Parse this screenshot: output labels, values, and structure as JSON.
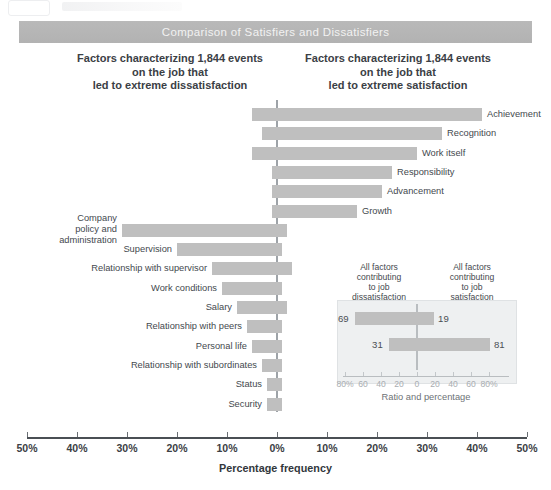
{
  "banner": {
    "title": "Comparison of Satisfiers and Dissatisfiers"
  },
  "captions": {
    "left": "Factors characterizing 1,844 events\non the job that\nled to extreme dissatisfaction",
    "right": "Factors characterizing 1,844 events\non the job that\nled to extreme satisfaction"
  },
  "axis": {
    "title": "Percentage frequency",
    "ticks": [
      "50%",
      "40%",
      "30%",
      "20%",
      "10%",
      "0%",
      "10%",
      "20%",
      "30%",
      "40%",
      "50%"
    ]
  },
  "inset": {
    "left_caption": "All factors\ncontributing\nto job\ndissatisfaction",
    "right_caption": "All factors\ncontributing\nto job\nsatisfaction",
    "title": "Ratio and percentage",
    "ticks": [
      "80%",
      "60",
      "40",
      "20",
      "0",
      "20",
      "40",
      "60",
      "80%"
    ]
  },
  "colors": {
    "bar": "#bfbfbf",
    "banner": "#b5b5b5",
    "axis": "#9ea3a8",
    "text": "#3f4448",
    "inset_panel": "#eef0f1"
  },
  "chart_data": {
    "type": "bar",
    "title": "Comparison of Satisfiers and Dissatisfiers",
    "xlabel": "Percentage frequency",
    "ylabel": "",
    "xlim": [
      -50,
      50
    ],
    "grid": false,
    "legend": "none",
    "orientation": "horizontal-diverging",
    "note": "Diverging bars: negative = percent of extreme dissatisfaction events, positive = percent of extreme satisfaction events",
    "categories": [
      "Achievement",
      "Recognition",
      "Work itself",
      "Responsibility",
      "Advancement",
      "Growth",
      "Company policy and administration",
      "Supervision",
      "Relationship with supervisor",
      "Work conditions",
      "Salary",
      "Relationship with peers",
      "Personal life",
      "Relationship with subordinates",
      "Status",
      "Security"
    ],
    "series": [
      {
        "name": "Extreme dissatisfaction (left of 0%)",
        "values": [
          5,
          3,
          5,
          1,
          1,
          1,
          31,
          20,
          13,
          11,
          8,
          6,
          5,
          3,
          2,
          2
        ]
      },
      {
        "name": "Extreme satisfaction (right of 0%)",
        "values": [
          41,
          33,
          28,
          23,
          21,
          16,
          2,
          1,
          3,
          1,
          2,
          1,
          1,
          1,
          1,
          1
        ]
      }
    ],
    "labels": [
      {
        "label": "Achievement",
        "dissatisfaction": 5,
        "satisfaction": 41
      },
      {
        "label": "Recognition",
        "dissatisfaction": 3,
        "satisfaction": 33
      },
      {
        "label": "Work itself",
        "dissatisfaction": 5,
        "satisfaction": 28
      },
      {
        "label": "Responsibility",
        "dissatisfaction": 1,
        "satisfaction": 23
      },
      {
        "label": "Advancement",
        "dissatisfaction": 1,
        "satisfaction": 21
      },
      {
        "label": "Growth",
        "dissatisfaction": 1,
        "satisfaction": 16
      },
      {
        "label": "Company policy and administration",
        "dissatisfaction": 31,
        "satisfaction": 2
      },
      {
        "label": "Supervision",
        "dissatisfaction": 20,
        "satisfaction": 1
      },
      {
        "label": "Relationship with supervisor",
        "dissatisfaction": 13,
        "satisfaction": 3
      },
      {
        "label": "Work conditions",
        "dissatisfaction": 11,
        "satisfaction": 1
      },
      {
        "label": "Salary",
        "dissatisfaction": 8,
        "satisfaction": 2
      },
      {
        "label": "Relationship with peers",
        "dissatisfaction": 6,
        "satisfaction": 1
      },
      {
        "label": "Personal life",
        "dissatisfaction": 5,
        "satisfaction": 1
      },
      {
        "label": "Relationship with subordinates",
        "dissatisfaction": 3,
        "satisfaction": 1
      },
      {
        "label": "Status",
        "dissatisfaction": 2,
        "satisfaction": 1
      },
      {
        "label": "Security",
        "dissatisfaction": 2,
        "satisfaction": 1
      }
    ],
    "inset_chart": {
      "type": "bar",
      "title": "Ratio and percentage",
      "orientation": "horizontal-diverging",
      "xlim": [
        -80,
        80
      ],
      "rows": [
        {
          "left_value": 69,
          "right_value": 19,
          "left_label": "69",
          "right_label": "19"
        },
        {
          "left_value": 31,
          "right_value": 81,
          "left_label": "31",
          "right_label": "81"
        }
      ]
    }
  },
  "rows": [
    {
      "label": "Achievement",
      "side": "right",
      "left": 5,
      "right": 41
    },
    {
      "label": "Recognition",
      "side": "right",
      "left": 3,
      "right": 33
    },
    {
      "label": "Work itself",
      "side": "right",
      "left": 5,
      "right": 28
    },
    {
      "label": "Responsibility",
      "side": "right",
      "left": 1,
      "right": 23
    },
    {
      "label": "Advancement",
      "side": "right",
      "left": 1,
      "right": 21
    },
    {
      "label": "Growth",
      "side": "right",
      "left": 1,
      "right": 16
    },
    {
      "label": "Company policy and administration",
      "side": "left",
      "left": 31,
      "right": 2
    },
    {
      "label": "Supervision",
      "side": "left",
      "left": 20,
      "right": 1
    },
    {
      "label": "Relationship with supervisor",
      "side": "left",
      "left": 13,
      "right": 3
    },
    {
      "label": "Work conditions",
      "side": "left",
      "left": 11,
      "right": 1
    },
    {
      "label": "Salary",
      "side": "left",
      "left": 8,
      "right": 2
    },
    {
      "label": "Relationship with peers",
      "side": "left",
      "left": 6,
      "right": 1
    },
    {
      "label": "Personal life",
      "side": "left",
      "left": 5,
      "right": 1
    },
    {
      "label": "Relationship with subordinates",
      "side": "left",
      "left": 3,
      "right": 1
    },
    {
      "label": "Status",
      "side": "left",
      "left": 2,
      "right": 1
    },
    {
      "label": "Security",
      "side": "left",
      "left": 2,
      "right": 1
    }
  ]
}
